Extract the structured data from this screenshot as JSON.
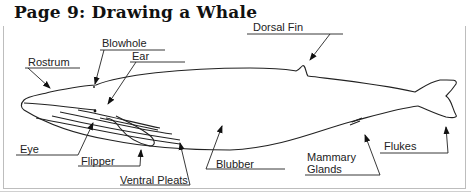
{
  "title": "Page 9: Drawing a Whale",
  "labels": {
    "blowhole": "Blowhole",
    "ear": "Ear",
    "rostrum": "Rostrum",
    "dorsal_fin": "Dorsal Fin",
    "eye": "Eye",
    "flipper": "Flipper",
    "ventral_pleats": "Ventral Pleats",
    "blubber": "Blubber",
    "mammary_glands_line1": "Mammary",
    "mammary_glands_line2": "Glands",
    "flukes": "Flukes"
  }
}
